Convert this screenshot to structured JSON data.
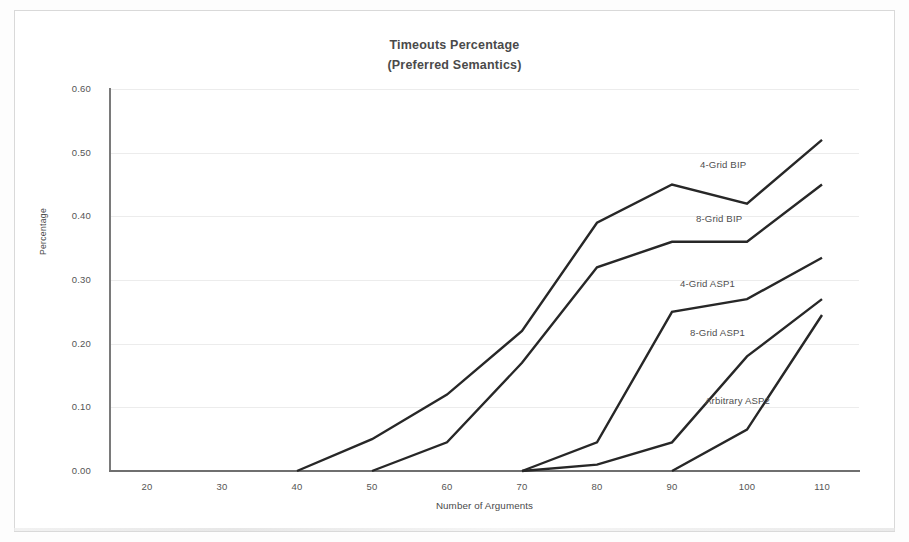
{
  "chart_data": {
    "type": "line",
    "title": "Timeouts Percentage",
    "subtitle": "(Preferred Semantics)",
    "xlabel": "Number of Arguments",
    "ylabel": "Percentage",
    "x": [
      20,
      30,
      40,
      50,
      60,
      70,
      80,
      90,
      100,
      110
    ],
    "xlim": [
      15,
      115
    ],
    "ylim": [
      0.0,
      0.6
    ],
    "yticks": [
      "0.00",
      "0.10",
      "0.20",
      "0.30",
      "0.40",
      "0.50",
      "0.60"
    ],
    "ytick_values": [
      0.0,
      0.1,
      0.2,
      0.3,
      0.4,
      0.5,
      0.6
    ],
    "xticks": [
      "20",
      "30",
      "40",
      "50",
      "60",
      "70",
      "80",
      "90",
      "100",
      "110"
    ],
    "grid": true,
    "legend": "inline-labels",
    "line_color": "#272727",
    "series": [
      {
        "name": "4-Grid BIP",
        "x": [
          40,
          50,
          60,
          70,
          80,
          90,
          100,
          110
        ],
        "values": [
          0.0,
          0.05,
          0.12,
          0.22,
          0.39,
          0.45,
          0.42,
          0.52
        ],
        "label_x": 110,
        "label_y": 0.52
      },
      {
        "name": "8-Grid BIP",
        "x": [
          50,
          60,
          70,
          80,
          90,
          100,
          110
        ],
        "values": [
          0.0,
          0.045,
          0.17,
          0.32,
          0.36,
          0.36,
          0.45
        ],
        "label_x": 110,
        "label_y": 0.45
      },
      {
        "name": "4-Grid ASP1",
        "x": [
          70,
          80,
          90,
          100,
          110
        ],
        "values": [
          0.0,
          0.045,
          0.25,
          0.27,
          0.335
        ],
        "label_x": 110,
        "label_y": 0.335
      },
      {
        "name": "8-Grid ASP1",
        "x": [
          70,
          80,
          90,
          100,
          110
        ],
        "values": [
          0.0,
          0.01,
          0.045,
          0.18,
          0.27
        ],
        "label_x": 110,
        "label_y": 0.27
      },
      {
        "name": "Arbitrary ASP2",
        "x": [
          90,
          100,
          110
        ],
        "values": [
          0.0,
          0.065,
          0.245
        ],
        "label_x": 110,
        "label_y": 0.245
      }
    ],
    "series_labels": [
      {
        "text": "4-Grid BIP",
        "left": 700,
        "top": 159
      },
      {
        "text": "8-Grid BIP",
        "left": 696,
        "top": 213
      },
      {
        "text": "4-Grid ASP1",
        "left": 680,
        "top": 278
      },
      {
        "text": "8-Grid ASP1",
        "left": 690,
        "top": 327
      },
      {
        "text": "Arbitrary ASP2",
        "left": 705,
        "top": 395
      }
    ]
  }
}
